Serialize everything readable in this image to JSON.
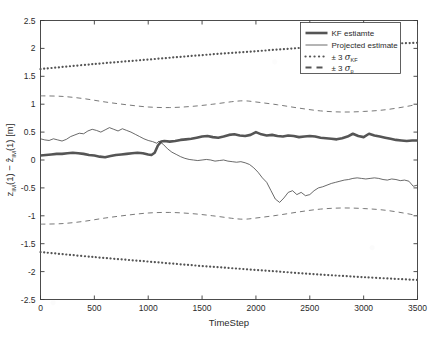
{
  "figure": {
    "background": "#ffffff",
    "plot_border_color": "#3a3a3a",
    "axis_text_color": "#2b2b2b"
  },
  "chart_data": {
    "type": "line",
    "title": "",
    "xlabel": "TimeStep",
    "ylabel": "z_IM(1) - ẑ_IM(1) [m]",
    "ylabel_parts": {
      "term1_base": "z",
      "term1_sub": "IM",
      "term1_arg": "(1)",
      "minus": "−",
      "term2_base": "ẑ",
      "term2_sub": "IM",
      "term2_arg": "(1)",
      "unit": "[m]"
    },
    "xlim": [
      0,
      3500
    ],
    "ylim": [
      -2.5,
      2.5
    ],
    "xticks": [
      0,
      500,
      1000,
      1500,
      2000,
      2500,
      3000,
      3500
    ],
    "xtick_labels": [
      "0",
      "500",
      "1000",
      "1500",
      "2000",
      "2500",
      "3000",
      "3500"
    ],
    "yticks": [
      -2.5,
      -2,
      -1.5,
      -1,
      -0.5,
      0,
      0.5,
      1,
      1.5,
      2,
      2.5
    ],
    "ytick_labels": [
      "-2.5",
      "-2",
      "-1.5",
      "-1",
      "-0.5",
      "0",
      "0.5",
      "1",
      "1.5",
      "2",
      "2.5"
    ],
    "grid": false,
    "legend_position": "top-right",
    "series": [
      {
        "name": "KF estiamte",
        "style": "solid-thick",
        "color": "#555555",
        "width": 2.6,
        "x": [
          0,
          50,
          100,
          150,
          200,
          250,
          300,
          350,
          400,
          450,
          500,
          550,
          600,
          650,
          700,
          750,
          800,
          850,
          900,
          950,
          1000,
          1030,
          1060,
          1090,
          1120,
          1150,
          1200,
          1250,
          1300,
          1350,
          1400,
          1450,
          1500,
          1550,
          1600,
          1650,
          1700,
          1750,
          1800,
          1850,
          1900,
          1950,
          2000,
          2050,
          2100,
          2150,
          2200,
          2250,
          2300,
          2350,
          2400,
          2450,
          2500,
          2550,
          2600,
          2650,
          2700,
          2750,
          2800,
          2850,
          2900,
          2950,
          3000,
          3050,
          3100,
          3150,
          3200,
          3250,
          3300,
          3350,
          3400,
          3450,
          3500
        ],
        "y": [
          0.08,
          0.09,
          0.1,
          0.11,
          0.11,
          0.12,
          0.13,
          0.12,
          0.11,
          0.09,
          0.08,
          0.06,
          0.05,
          0.07,
          0.09,
          0.1,
          0.11,
          0.12,
          0.13,
          0.12,
          0.1,
          0.09,
          0.13,
          0.26,
          0.33,
          0.34,
          0.33,
          0.34,
          0.36,
          0.37,
          0.38,
          0.4,
          0.42,
          0.43,
          0.41,
          0.4,
          0.42,
          0.45,
          0.46,
          0.44,
          0.43,
          0.45,
          0.5,
          0.46,
          0.44,
          0.45,
          0.43,
          0.42,
          0.44,
          0.43,
          0.41,
          0.42,
          0.43,
          0.42,
          0.4,
          0.39,
          0.38,
          0.37,
          0.39,
          0.42,
          0.47,
          0.43,
          0.41,
          0.47,
          0.44,
          0.42,
          0.4,
          0.38,
          0.36,
          0.35,
          0.34,
          0.35,
          0.35
        ]
      },
      {
        "name": "Projected estimate",
        "style": "solid-thin",
        "color": "#444444",
        "width": 0.8,
        "x": [
          0,
          40,
          80,
          120,
          160,
          200,
          240,
          280,
          320,
          360,
          400,
          440,
          480,
          520,
          560,
          600,
          640,
          680,
          720,
          760,
          800,
          840,
          880,
          920,
          960,
          1000,
          1040,
          1080,
          1100,
          1140,
          1180,
          1220,
          1260,
          1300,
          1340,
          1380,
          1420,
          1460,
          1500,
          1540,
          1580,
          1620,
          1660,
          1700,
          1740,
          1780,
          1820,
          1860,
          1900,
          1940,
          1980,
          2020,
          2060,
          2100,
          2140,
          2180,
          2220,
          2260,
          2300,
          2340,
          2380,
          2420,
          2460,
          2500,
          2540,
          2580,
          2620,
          2660,
          2700,
          2740,
          2780,
          2820,
          2860,
          2900,
          2940,
          2980,
          3020,
          3060,
          3100,
          3140,
          3180,
          3220,
          3260,
          3300,
          3340,
          3380,
          3420,
          3460,
          3500
        ],
        "y": [
          0.38,
          0.36,
          0.35,
          0.38,
          0.36,
          0.34,
          0.37,
          0.42,
          0.45,
          0.48,
          0.47,
          0.52,
          0.55,
          0.53,
          0.5,
          0.54,
          0.58,
          0.55,
          0.52,
          0.56,
          0.53,
          0.5,
          0.46,
          0.42,
          0.38,
          0.35,
          0.33,
          0.3,
          0.34,
          0.28,
          0.2,
          0.14,
          0.1,
          0.06,
          0.03,
          0.01,
          0.0,
          -0.01,
          0.0,
          0.01,
          0.0,
          -0.02,
          -0.01,
          0.0,
          -0.02,
          -0.03,
          -0.04,
          -0.03,
          -0.05,
          -0.08,
          -0.14,
          -0.22,
          -0.32,
          -0.4,
          -0.55,
          -0.7,
          -0.76,
          -0.68,
          -0.58,
          -0.55,
          -0.62,
          -0.58,
          -0.64,
          -0.62,
          -0.55,
          -0.5,
          -0.48,
          -0.45,
          -0.42,
          -0.4,
          -0.38,
          -0.36,
          -0.35,
          -0.33,
          -0.32,
          -0.33,
          -0.34,
          -0.33,
          -0.32,
          -0.33,
          -0.35,
          -0.36,
          -0.34,
          -0.35,
          -0.37,
          -0.36,
          -0.38,
          -0.47,
          -0.45
        ]
      },
      {
        "name": "+3 sigma_KF",
        "style": "dotted",
        "color": "#555555",
        "width": 2.2,
        "x": [
          0,
          500,
          1000,
          1500,
          2000,
          2500,
          3000,
          3500
        ],
        "y": [
          1.63,
          1.72,
          1.8,
          1.88,
          1.95,
          2.02,
          2.07,
          2.1
        ]
      },
      {
        "name": "-3 sigma_KF",
        "style": "dotted",
        "color": "#555555",
        "width": 2.2,
        "x": [
          0,
          500,
          1000,
          1500,
          2000,
          2500,
          3000,
          3500
        ],
        "y": [
          -1.65,
          -1.74,
          -1.82,
          -1.9,
          -1.97,
          -2.04,
          -2.1,
          -2.15
        ]
      },
      {
        "name": "+3 sigma_p",
        "style": "dashed",
        "color": "#6a6a6a",
        "width": 0.9,
        "x": [
          0,
          200,
          400,
          600,
          800,
          1000,
          1200,
          1400,
          1600,
          1800,
          1900,
          2000,
          2200,
          2400,
          2600,
          2800,
          3000,
          3200,
          3400,
          3500
        ],
        "y": [
          1.15,
          1.14,
          1.1,
          1.04,
          0.99,
          0.95,
          0.94,
          0.96,
          1.0,
          1.05,
          1.06,
          1.04,
          0.99,
          0.93,
          0.88,
          0.86,
          0.87,
          0.9,
          0.96,
          1.0
        ]
      },
      {
        "name": "-3 sigma_p",
        "style": "dashed",
        "color": "#6a6a6a",
        "width": 0.9,
        "x": [
          0,
          200,
          400,
          600,
          800,
          1000,
          1200,
          1400,
          1600,
          1800,
          1900,
          2000,
          2200,
          2400,
          2600,
          2800,
          3000,
          3200,
          3400,
          3500
        ],
        "y": [
          -1.15,
          -1.14,
          -1.1,
          -1.04,
          -0.99,
          -0.95,
          -0.94,
          -0.96,
          -1.0,
          -1.05,
          -1.06,
          -1.04,
          -0.99,
          -0.93,
          -0.88,
          -0.86,
          -0.87,
          -0.9,
          -0.96,
          -1.0
        ]
      }
    ],
    "legend": [
      {
        "label": "KF estiamte",
        "style": "solid-thick"
      },
      {
        "label": "Projected estimate",
        "style": "solid-thin"
      },
      {
        "label": "± 3 σ",
        "sub": "KF",
        "style": "dotted"
      },
      {
        "label": "± 3 σ",
        "sub": "p",
        "style": "dashed"
      }
    ]
  }
}
